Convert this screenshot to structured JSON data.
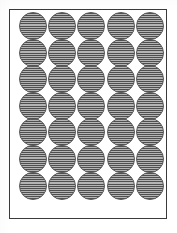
{
  "document": {
    "title": "Round Label Sheet Template",
    "kind": "label-sheet-diagram",
    "page_background": "#ffffff"
  },
  "sheet": {
    "border_color": "#3a3a3a",
    "border_width_px": 1.5,
    "fill_color": "#ffffff",
    "x": 9,
    "y": 9,
    "width": 158,
    "height": 210
  },
  "grid": {
    "columns": 5,
    "rows": 7,
    "total_labels": 35,
    "shape": "circle",
    "diameter_px": 28,
    "column_pitch_px": 29.2,
    "row_pitch_px": 26.6,
    "origin_x_px": 9,
    "origin_y_px": 11
  },
  "label_style": {
    "fill_color": "#9e9e9e",
    "outline_color": "#5a5a5a",
    "hatch_color": "#4f4f4f",
    "hatch_highlight_color": "#b4b4b4",
    "hatch_direction": "horizontal",
    "hatch_spacing_px": 2.1
  },
  "labels": [
    {
      "id": "label-r1-c1",
      "row": 1,
      "col": 1
    },
    {
      "id": "label-r1-c2",
      "row": 1,
      "col": 2
    },
    {
      "id": "label-r1-c3",
      "row": 1,
      "col": 3
    },
    {
      "id": "label-r1-c4",
      "row": 1,
      "col": 4
    },
    {
      "id": "label-r1-c5",
      "row": 1,
      "col": 5
    },
    {
      "id": "label-r2-c1",
      "row": 2,
      "col": 1
    },
    {
      "id": "label-r2-c2",
      "row": 2,
      "col": 2
    },
    {
      "id": "label-r2-c3",
      "row": 2,
      "col": 3
    },
    {
      "id": "label-r2-c4",
      "row": 2,
      "col": 4
    },
    {
      "id": "label-r2-c5",
      "row": 2,
      "col": 5
    },
    {
      "id": "label-r3-c1",
      "row": 3,
      "col": 1
    },
    {
      "id": "label-r3-c2",
      "row": 3,
      "col": 2
    },
    {
      "id": "label-r3-c3",
      "row": 3,
      "col": 3
    },
    {
      "id": "label-r3-c4",
      "row": 3,
      "col": 4
    },
    {
      "id": "label-r3-c5",
      "row": 3,
      "col": 5
    },
    {
      "id": "label-r4-c1",
      "row": 4,
      "col": 1
    },
    {
      "id": "label-r4-c2",
      "row": 4,
      "col": 2
    },
    {
      "id": "label-r4-c3",
      "row": 4,
      "col": 3
    },
    {
      "id": "label-r4-c4",
      "row": 4,
      "col": 4
    },
    {
      "id": "label-r4-c5",
      "row": 4,
      "col": 5
    },
    {
      "id": "label-r5-c1",
      "row": 5,
      "col": 1
    },
    {
      "id": "label-r5-c2",
      "row": 5,
      "col": 2
    },
    {
      "id": "label-r5-c3",
      "row": 5,
      "col": 3
    },
    {
      "id": "label-r5-c4",
      "row": 5,
      "col": 4
    },
    {
      "id": "label-r5-c5",
      "row": 5,
      "col": 5
    },
    {
      "id": "label-r6-c1",
      "row": 6,
      "col": 1
    },
    {
      "id": "label-r6-c2",
      "row": 6,
      "col": 2
    },
    {
      "id": "label-r6-c3",
      "row": 6,
      "col": 3
    },
    {
      "id": "label-r6-c4",
      "row": 6,
      "col": 4
    },
    {
      "id": "label-r6-c5",
      "row": 6,
      "col": 5
    },
    {
      "id": "label-r7-c1",
      "row": 7,
      "col": 1
    },
    {
      "id": "label-r7-c2",
      "row": 7,
      "col": 2
    },
    {
      "id": "label-r7-c3",
      "row": 7,
      "col": 3
    },
    {
      "id": "label-r7-c4",
      "row": 7,
      "col": 4
    },
    {
      "id": "label-r7-c5",
      "row": 7,
      "col": 5
    }
  ]
}
